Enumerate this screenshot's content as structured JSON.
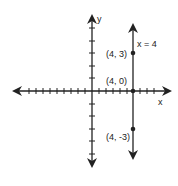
{
  "graph": {
    "x_axis_label": "x",
    "y_axis_label": "y",
    "line_label": "x = 4",
    "points": [
      {
        "label": "(4, 3)",
        "x": 4,
        "y": 3
      },
      {
        "label": "(4, 0)",
        "x": 4,
        "y": 0
      },
      {
        "label": "(4, -3)",
        "x": 4,
        "y": -3
      }
    ],
    "x_range": [
      -6,
      6
    ],
    "y_range": [
      -6,
      6
    ],
    "colors": {
      "axis": "#222222",
      "line": "#222222"
    }
  }
}
